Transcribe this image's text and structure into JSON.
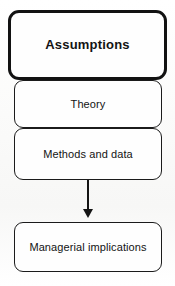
{
  "diagram": {
    "background_color": "#fdfdfc",
    "stroke_color": "#141414",
    "node_fill_color": "#fefefe",
    "nodes": [
      {
        "id": "assumptions",
        "label": "Assumptions",
        "emphasis": "bold",
        "shape": "rounded-rectangle",
        "border_weight": "thick"
      },
      {
        "id": "theory",
        "label": "Theory",
        "emphasis": "normal",
        "shape": "rounded-rectangle",
        "border_weight": "thin"
      },
      {
        "id": "methods-and-data",
        "label": "Methods and data",
        "emphasis": "normal",
        "shape": "rounded-rectangle",
        "border_weight": "thin"
      },
      {
        "id": "managerial-implications",
        "label": "Managerial implications",
        "emphasis": "normal",
        "shape": "rounded-rectangle",
        "border_weight": "thin"
      }
    ],
    "connectors": [
      {
        "id": "methods-to-implications",
        "from": "methods-and-data",
        "to": "managerial-implications",
        "style": "solid",
        "arrowhead": "filled-triangle",
        "direction": "down"
      }
    ]
  }
}
